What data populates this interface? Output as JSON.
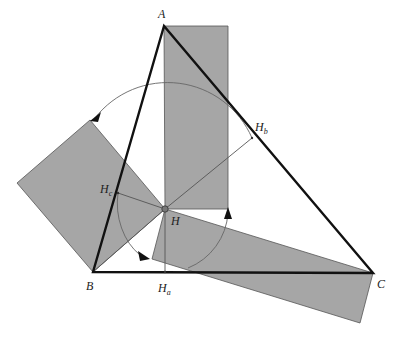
{
  "diagram": {
    "colors": {
      "fill": "#a6a6a6",
      "triangle_stroke": "#111111",
      "thin_stroke": "#555555",
      "background": "#ffffff"
    },
    "points": {
      "A": {
        "label": "A",
        "x": 164,
        "y": 26
      },
      "B": {
        "label": "B",
        "x": 93,
        "y": 272
      },
      "C": {
        "label": "C",
        "x": 373,
        "y": 273
      },
      "H": {
        "label": "H",
        "x": 165,
        "y": 209
      },
      "Ha": {
        "label": "H",
        "sub": "a",
        "x": 165,
        "y": 272
      },
      "Hb": {
        "label": "H",
        "sub": "b",
        "x": 252,
        "y": 138
      },
      "Hc": {
        "label": "H",
        "sub": "c",
        "x": 118,
        "y": 193
      }
    },
    "labels": {
      "A": "A",
      "B": "B",
      "C": "C",
      "H": "H",
      "Ha_main": "H",
      "Ha_sub": "a",
      "Hb_main": "H",
      "Hb_sub": "b",
      "Hc_main": "H",
      "Hc_sub": "c"
    },
    "shapes": [
      {
        "name": "top-rectangle",
        "points": "164,26 228,26 228,209 165,209"
      },
      {
        "name": "left-square",
        "points": "93,272 165,209 90,120 17,183"
      },
      {
        "name": "bottom-rectangle",
        "points": "165,209 373,273 360,323 152,259"
      }
    ],
    "arrows": [
      {
        "name": "upper-arc",
        "direction": "counterclockwise"
      },
      {
        "name": "lower-left-arc",
        "direction": "clockwise"
      },
      {
        "name": "lower-right-arc",
        "direction": "counterclockwise"
      }
    ]
  }
}
